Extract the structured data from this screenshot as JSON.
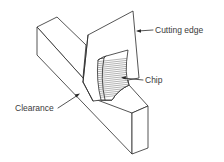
{
  "diagram": {
    "type": "orthogonal-cutting-illustration",
    "labels": {
      "cutting_edge": "Cutting edge",
      "chip": "Chip",
      "clearance": "Clearance"
    },
    "colors": {
      "line": "#2a2a2a",
      "text": "#3a3a3a",
      "background": "#ffffff"
    }
  }
}
